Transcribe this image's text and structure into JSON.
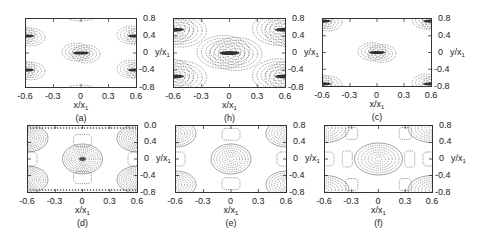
{
  "figure": {
    "panels": [
      {
        "id": "a",
        "label": "(a)",
        "frame": {
          "left": 25,
          "top": 18,
          "width": 112,
          "height": 70
        },
        "yticks": [
          "0.8",
          "0.4",
          "0",
          "-0.4",
          "-0.8"
        ],
        "xticks": [
          "-0.6",
          "-0.3",
          "0",
          "0.3",
          "0.6"
        ],
        "xlabel": "x/x",
        "xlabel_sub": "1",
        "ylabel": "y/x",
        "ylabel_sub": "1",
        "style": "localized"
      },
      {
        "id": "b",
        "label": "(h)",
        "frame": {
          "left": 173,
          "top": 18,
          "width": 113,
          "height": 70
        },
        "yticks": [
          "0.8",
          "0.4",
          "0",
          "-0.4",
          "-0.8"
        ],
        "xticks": [
          "-0.6",
          "-0.3",
          "0",
          "0.3",
          "0.6"
        ],
        "xlabel": "x/x",
        "xlabel_sub": "1",
        "ylabel": "y/x",
        "ylabel_sub": "1",
        "style": "localized-dense"
      },
      {
        "id": "c",
        "label": "(c)",
        "frame": {
          "left": 322,
          "top": 18,
          "width": 110,
          "height": 69
        },
        "yticks": [
          "0.8",
          "0.4",
          "0",
          "-0.4",
          "-0.8"
        ],
        "xticks": [
          "-0.6",
          "-0.3",
          "0",
          "0.3",
          "0.6"
        ],
        "xlabel": "x/x",
        "xlabel_sub": "1",
        "ylabel": "y/x",
        "ylabel_sub": "1",
        "style": "localized-corner"
      },
      {
        "id": "d",
        "label": "(d)",
        "frame": {
          "left": 27,
          "top": 125,
          "width": 111,
          "height": 68
        },
        "yticks": [
          "0.0",
          "0.4",
          "0",
          "-0.4",
          "-0.8"
        ],
        "xticks": [
          "-0.6",
          "-0.3",
          "0",
          "0.3",
          "0.6"
        ],
        "xlabel": "x/x",
        "xlabel_sub": "1",
        "ylabel": "y/x",
        "ylabel_sub": "1",
        "style": "periodic-dense"
      },
      {
        "id": "e",
        "label": "(e)",
        "frame": {
          "left": 175,
          "top": 125,
          "width": 112,
          "height": 68
        },
        "yticks": [
          "0.8",
          "0.4",
          "0",
          "-0.4",
          "-0.8"
        ],
        "xticks": [
          "-0.6",
          "-0.3",
          "0",
          "0.3",
          "0.6"
        ],
        "xlabel": "x/x",
        "xlabel_sub": "1",
        "ylabel": "y/x",
        "ylabel_sub": "1",
        "style": "periodic"
      },
      {
        "id": "f",
        "label": "(f)",
        "frame": {
          "left": 324,
          "top": 125,
          "width": 109,
          "height": 68
        },
        "yticks": [
          "0.8",
          "0.4",
          "0",
          "-0.4",
          "-0.8"
        ],
        "xticks": [
          "-0.6",
          "-0.3",
          "0",
          "0.3",
          "0.6"
        ],
        "xlabel": "x/x",
        "xlabel_sub": "1",
        "ylabel": "y/x",
        "ylabel_sub": "1",
        "style": "periodic-wide"
      }
    ]
  },
  "chart_data": [
    {
      "type": "contour",
      "panel": "(a)",
      "xlabel": "x/x1",
      "ylabel": "y/x1",
      "xlim": [
        -0.6,
        0.6
      ],
      "ylim": [
        -0.8,
        0.8
      ],
      "xticks": [
        -0.6,
        -0.3,
        0,
        0.3,
        0.6
      ],
      "yticks": [
        0.8,
        0.4,
        0,
        -0.4,
        -0.8
      ],
      "features": "localized vortex-pair contours at (0,0), (±0.6,±0.4) and faint lobes at (0,±0.8)"
    },
    {
      "type": "contour",
      "panel": "(h)",
      "xlabel": "x/x1",
      "ylabel": "y/x1",
      "xlim": [
        -0.6,
        0.6
      ],
      "ylim": [
        -0.8,
        0.8
      ],
      "xticks": [
        -0.6,
        -0.3,
        0,
        0.3,
        0.6
      ],
      "yticks": [
        0.8,
        0.4,
        0,
        -0.4,
        -0.8
      ],
      "features": "denser localized contours at (0,0) and (±0.6,±0.55)"
    },
    {
      "type": "contour",
      "panel": "(c)",
      "xlabel": "x/x1",
      "ylabel": "y/x1",
      "xlim": [
        -0.6,
        0.6
      ],
      "ylim": [
        -0.8,
        0.8
      ],
      "xticks": [
        -0.6,
        -0.3,
        0,
        0.3,
        0.6
      ],
      "yticks": [
        0.8,
        0.4,
        0,
        -0.4,
        -0.8
      ],
      "features": "localized contours at (0,0) and near corners (±0.6,±0.8)"
    },
    {
      "type": "contour",
      "panel": "(d)",
      "xlabel": "x/x1",
      "ylabel": "y/x1",
      "xlim": [
        -0.6,
        0.6
      ],
      "ylim": [
        -0.8,
        0.8
      ],
      "xticks": [
        -0.6,
        -0.3,
        0,
        0.3,
        0.6
      ],
      "yticks": [
        "0.0",
        0.4,
        0,
        -0.4,
        -0.8
      ],
      "features": "periodic cellular pattern, dense dotted contours, ellipses at (0,0),(±0.6,±0.4),(±0.3,±0.4)"
    },
    {
      "type": "contour",
      "panel": "(e)",
      "xlabel": "x/x1",
      "ylabel": "y/x1",
      "xlim": [
        -0.6,
        0.6
      ],
      "ylim": [
        -0.8,
        0.8
      ],
      "xticks": [
        -0.6,
        -0.3,
        0,
        0.3,
        0.6
      ],
      "yticks": [
        0.8,
        0.4,
        0,
        -0.4,
        -0.8
      ],
      "features": "periodic cellular pattern, central ellipse at (0,0), corner lobes at (±0.6,±0.6), rounded rectangles at (±0.3,±0.6) and (±0.6,0)"
    },
    {
      "type": "contour",
      "panel": "(f)",
      "xlabel": "x/x1",
      "ylabel": "y/x1",
      "xlim": [
        -0.6,
        0.6
      ],
      "ylim": [
        -0.8,
        0.8
      ],
      "xticks": [
        -0.6,
        -0.3,
        0,
        0.3,
        0.6
      ],
      "yticks": [
        0.8,
        0.4,
        0,
        -0.4,
        -0.8
      ],
      "features": "periodic pattern with wide central ellipse at (0,0), corner lobes at (±0.5,±0.75)"
    }
  ]
}
